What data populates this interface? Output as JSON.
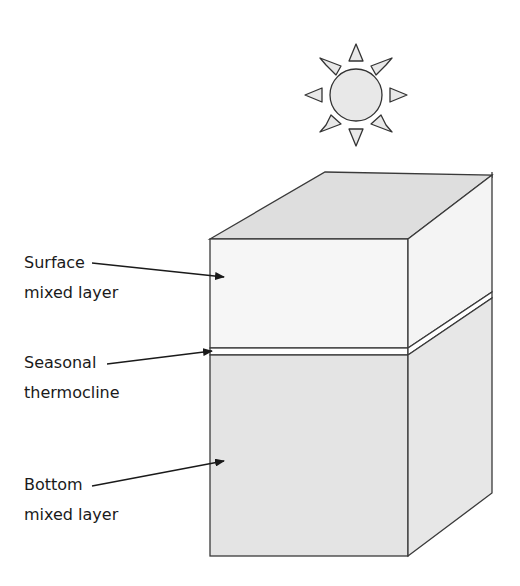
{
  "diagram": {
    "type": "ocean-stratification-block",
    "sun": {
      "icon": "sun-icon",
      "fill": "#e6e6e6",
      "stroke": "#333333"
    },
    "layers": [
      {
        "id": "surface",
        "label_line1": "Surface",
        "label_line2": "mixed layer",
        "fill": "#f7f7f7"
      },
      {
        "id": "thermocline",
        "label_line1": "Seasonal",
        "label_line2": "thermocline",
        "fill": "#ffffff"
      },
      {
        "id": "bottom",
        "label_line1": "Bottom",
        "label_line2": "mixed layer",
        "fill": "#e3e3e3"
      }
    ],
    "colors": {
      "top_face": "#dcdcdc",
      "surface_front": "#f6f6f6",
      "surface_side": "#f3f3f3",
      "bottom_front": "#e4e4e4",
      "bottom_side": "#e6e6e6",
      "outline": "#3a3a3a"
    }
  }
}
